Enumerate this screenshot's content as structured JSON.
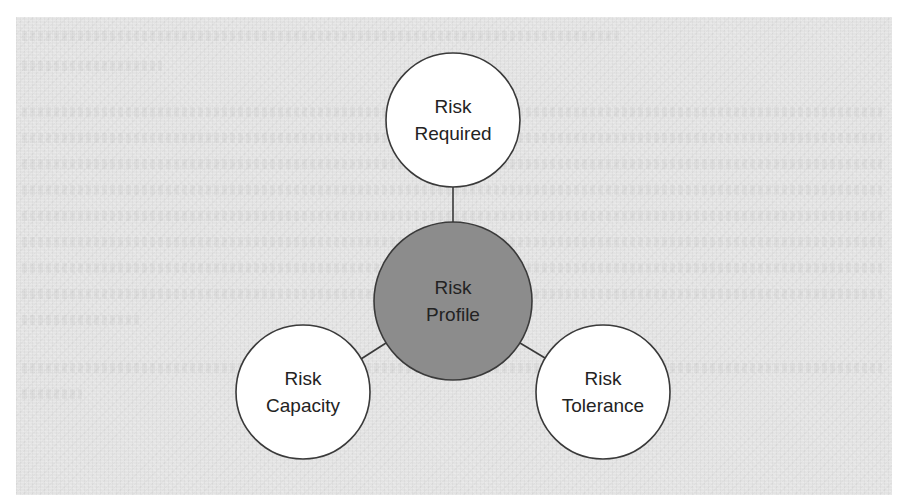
{
  "diagram": {
    "type": "hub-and-spoke",
    "colors": {
      "background_panel": "#e3e3e3",
      "outer_node_fill": "#ffffff",
      "center_node_fill": "#8c8c8c",
      "stroke": "#3a3a3a",
      "text": "#232323"
    },
    "center": {
      "id": "risk-profile",
      "line1": "Risk",
      "line2": "Profile",
      "cx": 453,
      "cy": 301,
      "r": 79
    },
    "nodes": [
      {
        "id": "risk-required",
        "line1": "Risk",
        "line2": "Required",
        "cx": 453,
        "cy": 120,
        "r": 67
      },
      {
        "id": "risk-capacity",
        "line1": "Risk",
        "line2": "Capacity",
        "cx": 303,
        "cy": 392,
        "r": 67
      },
      {
        "id": "risk-tolerance",
        "line1": "Risk",
        "line2": "Tolerance",
        "cx": 603,
        "cy": 392,
        "r": 67
      }
    ],
    "edges": [
      {
        "from": "risk-profile",
        "to": "risk-required"
      },
      {
        "from": "risk-profile",
        "to": "risk-capacity"
      },
      {
        "from": "risk-profile",
        "to": "risk-tolerance"
      }
    ]
  }
}
